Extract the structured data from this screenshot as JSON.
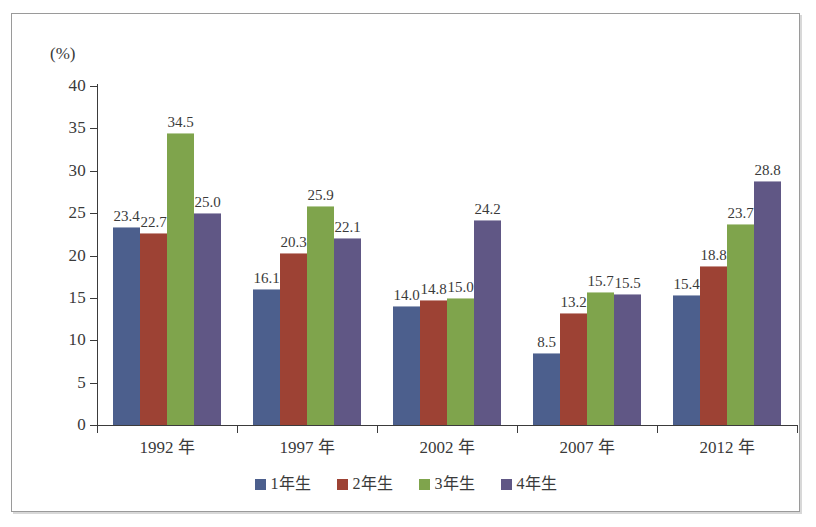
{
  "chart_data": {
    "type": "bar",
    "title": "",
    "subtitle": "",
    "xlabel": "",
    "ylabel": "(%)",
    "unit_label": "(%)",
    "categories": [
      "1992 年",
      "1997 年",
      "2002 年",
      "2007 年",
      "2012 年"
    ],
    "series": [
      {
        "name": "1年生",
        "color": "#4c5f8d",
        "values": [
          23.4,
          16.1,
          14.0,
          8.5,
          15.4
        ]
      },
      {
        "name": "2年生",
        "color": "#9d4234",
        "values": [
          22.7,
          20.3,
          14.8,
          13.2,
          18.8
        ]
      },
      {
        "name": "3年生",
        "color": "#7fa44c",
        "values": [
          34.5,
          25.9,
          15.0,
          15.7,
          23.7
        ]
      },
      {
        "name": "4年生",
        "color": "#605785",
        "values": [
          25.0,
          22.1,
          24.2,
          15.5,
          28.8
        ]
      }
    ],
    "value_labels": [
      [
        "23.4",
        "22.7",
        "34.5",
        "25.0"
      ],
      [
        "16.1",
        "20.3",
        "25.9",
        "22.1"
      ],
      [
        "14.0",
        "14.8",
        "15.0",
        "24.2"
      ],
      [
        "8.5",
        "13.2",
        "15.7",
        "15.5"
      ],
      [
        "15.4",
        "18.8",
        "23.7",
        "28.8"
      ]
    ],
    "ylim": [
      0,
      40
    ],
    "yticks": [
      0,
      5,
      10,
      15,
      20,
      25,
      30,
      35,
      40
    ],
    "ytick_labels": [
      "0",
      "5",
      "10",
      "15",
      "20",
      "25",
      "30",
      "35",
      "40"
    ],
    "grid": false,
    "legend_position": "bottom",
    "frame": true
  }
}
